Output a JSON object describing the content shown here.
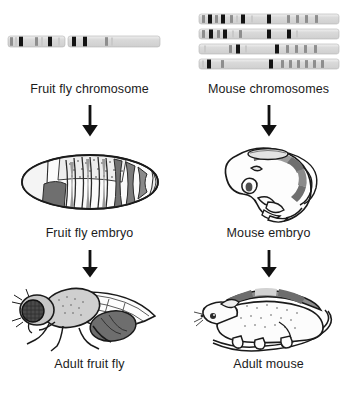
{
  "figure": {
    "columns": [
      {
        "id": "fruit-fly",
        "organism": "Fruit fly",
        "stages": [
          {
            "id": "chromosome",
            "label": "Fruit fly chromosome",
            "art": "fruit-fly-chromosome"
          },
          {
            "id": "embryo",
            "label": "Fruit fly embryo",
            "art": "fruit-fly-embryo"
          },
          {
            "id": "adult",
            "label": "Adult fruit fly",
            "art": "adult-fruit-fly"
          }
        ]
      },
      {
        "id": "mouse",
        "organism": "Mouse",
        "stages": [
          {
            "id": "chromosome",
            "label": "Mouse chromosomes",
            "art": "mouse-chromosomes"
          },
          {
            "id": "embryo",
            "label": "Mouse embryo",
            "art": "mouse-embryo"
          },
          {
            "id": "adult",
            "label": "Adult mouse",
            "art": "adult-mouse"
          }
        ]
      }
    ],
    "arrows": [
      {
        "id": "fly-chromosome-to-embryo",
        "direction": "down"
      },
      {
        "id": "fly-embryo-to-adult",
        "direction": "down"
      },
      {
        "id": "mouse-chromosome-to-embryo",
        "direction": "down"
      },
      {
        "id": "mouse-embryo-to-adult",
        "direction": "down"
      }
    ],
    "colors": {
      "background": "#ffffff",
      "ink": "#1a1a1a",
      "band_dark": "#111111",
      "band_mid": "#8e8e8e",
      "band_light": "#c9c9c9",
      "chromosome_body": "#dedede",
      "segment_gray": "#7d7d7d",
      "stipple_gray": "#a8a8a8"
    },
    "chromosome_bands": {
      "fruit_fly": {
        "arms": [
          {
            "id": "left-arm",
            "bands": [
              {
                "x": 2,
                "w": 3,
                "tone": "mid"
              },
              {
                "x": 7,
                "w": 2,
                "tone": "light"
              },
              {
                "x": 11,
                "w": 4,
                "tone": "dark"
              },
              {
                "x": 27,
                "w": 3,
                "tone": "mid"
              },
              {
                "x": 33,
                "w": 2,
                "tone": "light"
              },
              {
                "x": 40,
                "w": 4,
                "tone": "dark"
              },
              {
                "x": 50,
                "w": 2,
                "tone": "light"
              }
            ]
          },
          {
            "id": "right-arm",
            "bands": [
              {
                "x": 4,
                "w": 4,
                "tone": "dark"
              },
              {
                "x": 15,
                "w": 4,
                "tone": "dark"
              },
              {
                "x": 37,
                "w": 3,
                "tone": "mid"
              },
              {
                "x": 43,
                "w": 2,
                "tone": "light"
              }
            ]
          }
        ]
      },
      "mouse": [
        {
          "id": "chromosome-1",
          "bands": [
            {
              "x": 3,
              "w": 3,
              "tone": "mid"
            },
            {
              "x": 9,
              "w": 4,
              "tone": "dark"
            },
            {
              "x": 16,
              "w": 3,
              "tone": "mid"
            },
            {
              "x": 22,
              "w": 4,
              "tone": "dark"
            },
            {
              "x": 31,
              "w": 3,
              "tone": "mid"
            },
            {
              "x": 37,
              "w": 2,
              "tone": "light"
            },
            {
              "x": 42,
              "w": 4,
              "tone": "dark"
            },
            {
              "x": 52,
              "w": 2,
              "tone": "light"
            },
            {
              "x": 68,
              "w": 4,
              "tone": "dark"
            },
            {
              "x": 88,
              "w": 3,
              "tone": "mid"
            },
            {
              "x": 97,
              "w": 3,
              "tone": "mid"
            },
            {
              "x": 106,
              "w": 3,
              "tone": "mid"
            },
            {
              "x": 116,
              "w": 3,
              "tone": "mid"
            }
          ]
        },
        {
          "id": "chromosome-2",
          "bands": [
            {
              "x": 3,
              "w": 3,
              "tone": "mid"
            },
            {
              "x": 10,
              "w": 4,
              "tone": "dark"
            },
            {
              "x": 18,
              "w": 3,
              "tone": "mid"
            },
            {
              "x": 24,
              "w": 4,
              "tone": "dark"
            },
            {
              "x": 33,
              "w": 2,
              "tone": "light"
            },
            {
              "x": 40,
              "w": 3,
              "tone": "mid"
            },
            {
              "x": 68,
              "w": 4,
              "tone": "dark"
            },
            {
              "x": 88,
              "w": 4,
              "tone": "dark"
            },
            {
              "x": 97,
              "w": 2,
              "tone": "light"
            }
          ]
        },
        {
          "id": "chromosome-3",
          "bands": [
            {
              "x": 5,
              "w": 2,
              "tone": "light"
            },
            {
              "x": 30,
              "w": 3,
              "tone": "mid"
            },
            {
              "x": 37,
              "w": 4,
              "tone": "dark"
            },
            {
              "x": 46,
              "w": 2,
              "tone": "light"
            },
            {
              "x": 76,
              "w": 4,
              "tone": "dark"
            },
            {
              "x": 87,
              "w": 3,
              "tone": "mid"
            },
            {
              "x": 96,
              "w": 3,
              "tone": "mid"
            },
            {
              "x": 105,
              "w": 3,
              "tone": "mid"
            },
            {
              "x": 115,
              "w": 3,
              "tone": "mid"
            }
          ]
        },
        {
          "id": "chromosome-4",
          "bands": [
            {
              "x": 3,
              "w": 2,
              "tone": "light"
            },
            {
              "x": 8,
              "w": 4,
              "tone": "dark"
            },
            {
              "x": 22,
              "w": 3,
              "tone": "mid"
            },
            {
              "x": 70,
              "w": 4,
              "tone": "dark"
            },
            {
              "x": 82,
              "w": 3,
              "tone": "mid"
            },
            {
              "x": 90,
              "w": 3,
              "tone": "mid"
            },
            {
              "x": 98,
              "w": 3,
              "tone": "mid"
            },
            {
              "x": 106,
              "w": 3,
              "tone": "mid"
            },
            {
              "x": 114,
              "w": 3,
              "tone": "mid"
            },
            {
              "x": 122,
              "w": 3,
              "tone": "mid"
            }
          ]
        }
      ]
    }
  }
}
